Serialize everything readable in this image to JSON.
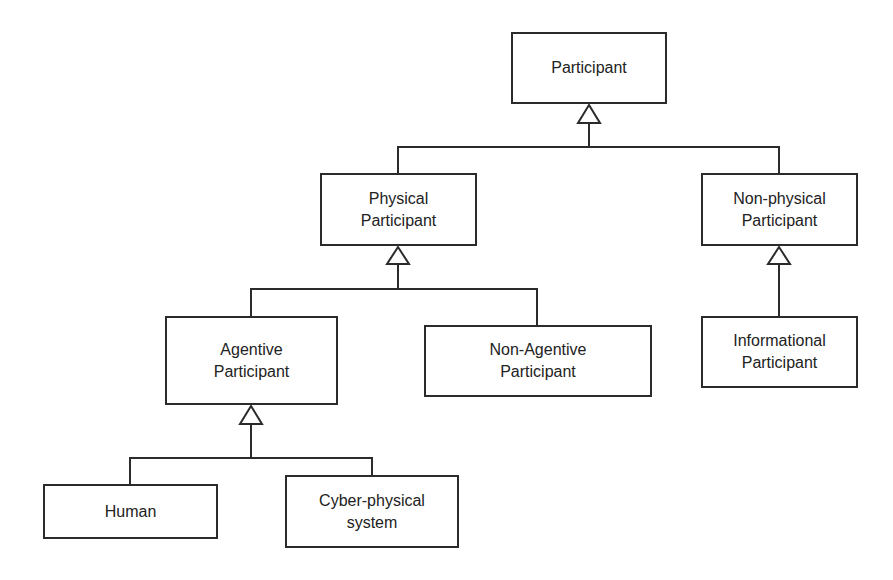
{
  "diagram": {
    "type": "UML class generalization hierarchy",
    "nodes": {
      "participant": "Participant",
      "physical": "Physical\nParticipant",
      "nonphysical": "Non-physical\nParticipant",
      "agentive": "Agentive\nParticipant",
      "nonagentive": "Non-Agentive\nParticipant",
      "informational": "Informational\nParticipant",
      "human": "Human",
      "cyber": "Cyber-physical\nsystem"
    },
    "edges": [
      {
        "from": "physical",
        "to": "participant",
        "kind": "generalization"
      },
      {
        "from": "nonphysical",
        "to": "participant",
        "kind": "generalization"
      },
      {
        "from": "agentive",
        "to": "physical",
        "kind": "generalization"
      },
      {
        "from": "nonagentive",
        "to": "physical",
        "kind": "generalization"
      },
      {
        "from": "informational",
        "to": "nonphysical",
        "kind": "generalization"
      },
      {
        "from": "human",
        "to": "agentive",
        "kind": "generalization"
      },
      {
        "from": "cyber",
        "to": "agentive",
        "kind": "generalization"
      }
    ]
  }
}
